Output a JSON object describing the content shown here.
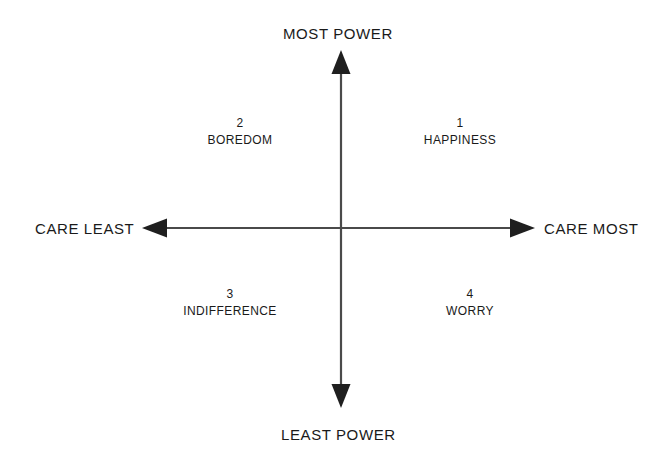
{
  "diagram": {
    "type": "quadrant-chart",
    "background_color": "#ffffff",
    "line_color": "#4a4a4a",
    "text_color": "#1a1a1a",
    "axes": {
      "vertical": {
        "top_label": "MOST POWER",
        "bottom_label": "LEAST POWER",
        "arrowheads": "both"
      },
      "horizontal": {
        "left_label": "CARE LEAST",
        "right_label": "CARE MOST",
        "arrowheads": "both"
      }
    },
    "quadrants": [
      {
        "number": "1",
        "name": "HAPPINESS",
        "position": "top-right",
        "meaning": "care most / most power"
      },
      {
        "number": "2",
        "name": "BOREDOM",
        "position": "top-left",
        "meaning": "care least / most power"
      },
      {
        "number": "3",
        "name": "INDIFFERENCE",
        "position": "bottom-left",
        "meaning": "care least / least power"
      },
      {
        "number": "4",
        "name": "WORRY",
        "position": "bottom-right",
        "meaning": "care most / least power"
      }
    ]
  }
}
